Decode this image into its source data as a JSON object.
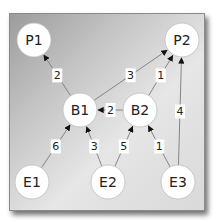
{
  "diagram": {
    "type": "directed-weighted-graph",
    "nodes": [
      {
        "id": "P1",
        "label": "P1",
        "x": 34,
        "y": 40
      },
      {
        "id": "P2",
        "label": "P2",
        "x": 182,
        "y": 40
      },
      {
        "id": "B1",
        "label": "B1",
        "x": 80,
        "y": 110
      },
      {
        "id": "B2",
        "label": "B2",
        "x": 140,
        "y": 110
      },
      {
        "id": "E1",
        "label": "E1",
        "x": 32,
        "y": 182
      },
      {
        "id": "E2",
        "label": "E2",
        "x": 108,
        "y": 182
      },
      {
        "id": "E3",
        "label": "E3",
        "x": 178,
        "y": 182
      }
    ],
    "edges": [
      {
        "from": "B1",
        "to": "P1",
        "weight": "2"
      },
      {
        "from": "B1",
        "to": "P2",
        "weight": "3"
      },
      {
        "from": "B2",
        "to": "P2",
        "weight": "1"
      },
      {
        "from": "E3",
        "to": "P2",
        "weight": "4"
      },
      {
        "from": "B2",
        "to": "B1",
        "weight": "2"
      },
      {
        "from": "E1",
        "to": "B1",
        "weight": "6"
      },
      {
        "from": "E2",
        "to": "B1",
        "weight": "3"
      },
      {
        "from": "E2",
        "to": "B2",
        "weight": "5"
      },
      {
        "from": "E3",
        "to": "B2",
        "weight": "1"
      }
    ]
  }
}
